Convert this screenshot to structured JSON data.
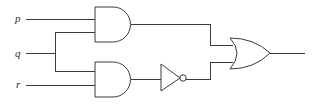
{
  "figure": {
    "type": "logic-circuit",
    "background_color": "#ffffff",
    "line_color": "#3a3a3a",
    "text_color": "#2b2b2b"
  },
  "inputs": [
    {
      "id": "p",
      "label": "p",
      "label_x": 15,
      "label_y": 22,
      "wire_y": 19
    },
    {
      "id": "q",
      "label": "q",
      "label_x": 15,
      "label_y": 57,
      "wire_y": 53
    },
    {
      "id": "r",
      "label": "r",
      "label_x": 16,
      "label_y": 88,
      "wire_y": 85
    }
  ],
  "gates": [
    {
      "id": "and-top",
      "type": "AND",
      "label": "AND gate (top)",
      "x": 95,
      "y": 7,
      "width": 36,
      "height": 35,
      "input_wire_ys": [
        19,
        33
      ],
      "output_y": 24
    },
    {
      "id": "and-bottom",
      "type": "AND",
      "label": "AND gate (bottom)",
      "x": 95,
      "y": 62,
      "width": 36,
      "height": 35,
      "input_wire_ys": [
        71,
        85
      ],
      "output_y": 79
    },
    {
      "id": "not-gate",
      "type": "NOT",
      "label": "NOT gate (inverter)",
      "x": 161,
      "y": 64,
      "width": 19,
      "height": 27,
      "bubble_cx": 183,
      "bubble_cy": 78,
      "bubble_r": 3.2,
      "input_y": 78,
      "output_y": 78
    },
    {
      "id": "or-gate",
      "type": "OR",
      "label": "OR gate",
      "x": 230,
      "y": 38,
      "width": 40,
      "height": 31,
      "input_wire_ys": [
        45,
        62
      ],
      "output_y": 53
    }
  ],
  "wires": [
    {
      "id": "wire-p-to-and-top",
      "label": "p to top AND input 1",
      "path": "M 26 19 L 95 19"
    },
    {
      "id": "wire-q-stub",
      "label": "q stub to branch node",
      "path": "M 26 53 L 55 53"
    },
    {
      "id": "wire-q-branch-vertical",
      "label": "q vertical branch",
      "path": "M 55 32 L 55 71"
    },
    {
      "id": "wire-q-to-and-top",
      "label": "q to top AND input 2",
      "path": "M 55 32 L 95 32"
    },
    {
      "id": "wire-q-to-and-bottom",
      "label": "q to bottom AND input 1",
      "path": "M 55 71 L 95 71"
    },
    {
      "id": "wire-r-to-and-bottom",
      "label": "r to bottom AND input 2",
      "path": "M 26 85 L 95 85"
    },
    {
      "id": "wire-and-top-to-or",
      "label": "top AND output to OR input 1",
      "path": "M 131 24 L 210 24 L 210 45 L 233 45"
    },
    {
      "id": "wire-and-bottom-to-not",
      "label": "bottom AND output to NOT input",
      "path": "M 131 79 L 161 79"
    },
    {
      "id": "wire-not-to-or",
      "label": "NOT output to OR input 2",
      "path": "M 186 79 L 210 79 L 210 62 L 233 62"
    },
    {
      "id": "wire-or-output",
      "label": "OR output",
      "path": "M 270 53 L 305 53"
    }
  ]
}
